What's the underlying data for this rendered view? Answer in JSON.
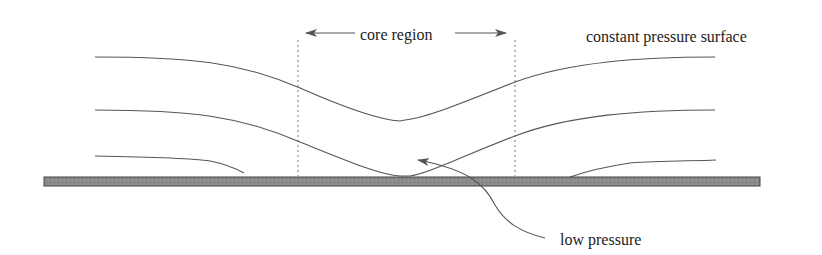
{
  "labels": {
    "core_region": "core region",
    "constant_pressure_surface": "constant pressure surface",
    "low_pressure": "low pressure"
  },
  "colors": {
    "background": "#ffffff",
    "line": "#555555",
    "text": "#222222",
    "ground_fill": "#8a8a8a",
    "ground_stroke": "#444444",
    "dotted": "#777777"
  },
  "diagram": {
    "curves": [
      {
        "name": "upper-pressure-surface",
        "dips_to_center": true
      },
      {
        "name": "middle-pressure-surface",
        "dips_to_center": true
      },
      {
        "name": "lower-pressure-surface-left",
        "meets_ground": true
      },
      {
        "name": "lower-pressure-surface-right",
        "meets_ground": true
      }
    ],
    "core_region_bounds": {
      "left_x": 298,
      "right_x": 515
    },
    "ground": {
      "x": 44,
      "y": 177,
      "width": 716,
      "height": 9
    }
  }
}
